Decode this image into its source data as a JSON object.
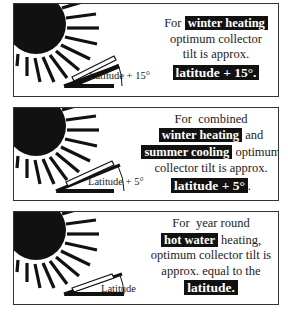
{
  "panels": [
    {
      "id": "winter",
      "angle_label": "Latitude + 15°",
      "lines": {
        "l1_pre": "For",
        "l1_hl": "winter heating",
        "l2": "optimum collector",
        "l3": "tilt is approx.",
        "l4_hl": "latitude + 15°."
      },
      "tilt_deg": 33
    },
    {
      "id": "combined",
      "angle_label": "Latitude + 5°",
      "lines": {
        "l1": "For  combined",
        "l2_hl": "winter heating",
        "l2_post": "and",
        "l3_hl": "summer cooling",
        "l3_post": "optimum",
        "l4": "collector tilt is approx.",
        "l5_hl": "latitude + 5°",
        "l5_post": "."
      },
      "tilt_deg": 28
    },
    {
      "id": "hotwater",
      "angle_label": "Latitude",
      "lines": {
        "l1": "For  year round",
        "l2_hl": "hot water",
        "l2_post": "heating,",
        "l3": "optimum collector tilt is",
        "l4": "approx. equal to the",
        "l5_hl": "latitude."
      },
      "tilt_deg": 20
    }
  ],
  "icons": [
    "sun-icon",
    "solar-collector-icon",
    "tilt-angle-arc-icon"
  ],
  "colors": {
    "ink": "#111111",
    "border": "#333333",
    "background": "#ffffff"
  }
}
